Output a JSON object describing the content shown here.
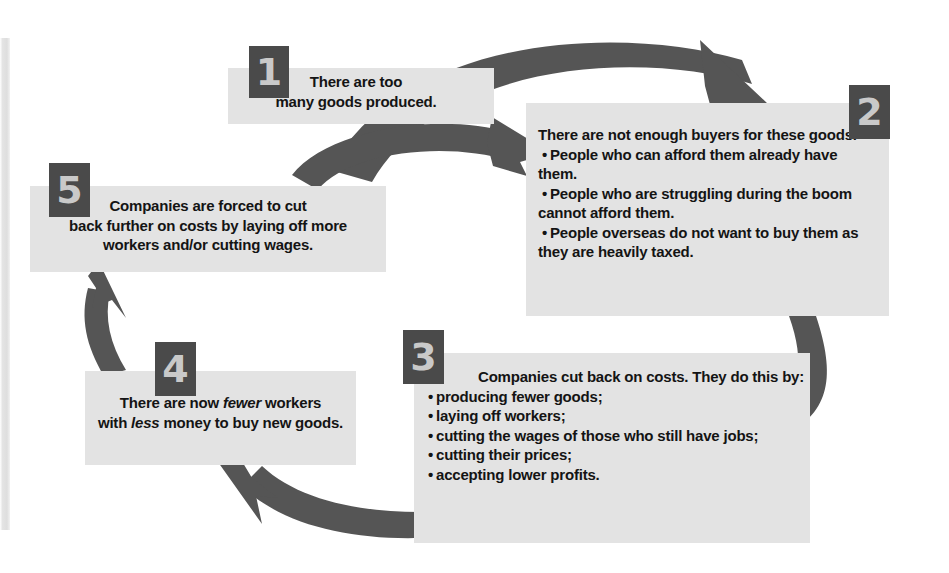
{
  "diagram": {
    "box_fill_color": "#e3e3e3",
    "arrow_color": "#555555",
    "badge_color": "#4a4a4a",
    "badge_text_color": "#c9c9c9",
    "steps": [
      {
        "number": "1",
        "lines": [
          "There are too",
          "many goods produced."
        ],
        "bullets": []
      },
      {
        "number": "2",
        "lines": [
          "There are not enough buyers for these goods."
        ],
        "bullets": [
          "People who can afford them already have them.",
          "People who are struggling during the boom cannot afford them.",
          "People overseas do not want to buy them as they are heavily taxed."
        ]
      },
      {
        "number": "3",
        "lines": [
          "Companies cut back on costs. They do this by:"
        ],
        "bullets": [
          "producing fewer goods;",
          "laying off workers;",
          "cutting the wages of those who still have jobs;",
          "cutting their prices;",
          "accepting lower profits."
        ]
      },
      {
        "number": "4",
        "lines_rich": [
          [
            {
              "t": "There are now "
            },
            {
              "t": "fewer",
              "i": true
            },
            {
              "t": " workers"
            }
          ],
          [
            {
              "t": "with "
            },
            {
              "t": "less",
              "i": true
            },
            {
              "t": " money to buy new goods."
            }
          ]
        ],
        "bullets": []
      },
      {
        "number": "5",
        "lines": [
          "Companies are forced to cut",
          "back further on costs by laying off more",
          "workers and/or cutting wages."
        ],
        "bullets": []
      }
    ],
    "connections": [
      {
        "from": "5",
        "to": "1",
        "name": "arrow-5-to-1"
      },
      {
        "from": "1",
        "to": "2",
        "name": "arrow-1-to-2"
      },
      {
        "from": "2",
        "to": "3",
        "name": "arrow-2-to-3"
      },
      {
        "from": "3",
        "to": "4",
        "name": "arrow-3-to-4"
      },
      {
        "from": "4",
        "to": "5",
        "name": "arrow-4-to-5"
      }
    ]
  }
}
